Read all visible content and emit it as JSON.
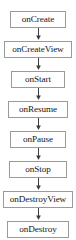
{
  "diagram": {
    "type": "vertical-flowchart",
    "background_color": "#ffffff",
    "node_border_color": "#9a9a9a",
    "node_fill_color": "#ffffff",
    "text_color": "#161616",
    "connector_color": "#3c3c3c",
    "connector_label": "arrow-down",
    "nodes": [
      {
        "id": "onCreate",
        "label": "onCreate",
        "width": 56
      },
      {
        "id": "onCreateView",
        "label": "onCreateView",
        "width": 68
      },
      {
        "id": "onStart",
        "label": "onStart",
        "width": 54
      },
      {
        "id": "onResume",
        "label": "onResume",
        "width": 60
      },
      {
        "id": "onPause",
        "label": "onPause",
        "width": 56
      },
      {
        "id": "onStop",
        "label": "onStop",
        "width": 58
      },
      {
        "id": "onDestroyView",
        "label": "onDestroyView",
        "width": 70
      },
      {
        "id": "onDestroy",
        "label": "onDestroy",
        "width": 62
      }
    ]
  }
}
